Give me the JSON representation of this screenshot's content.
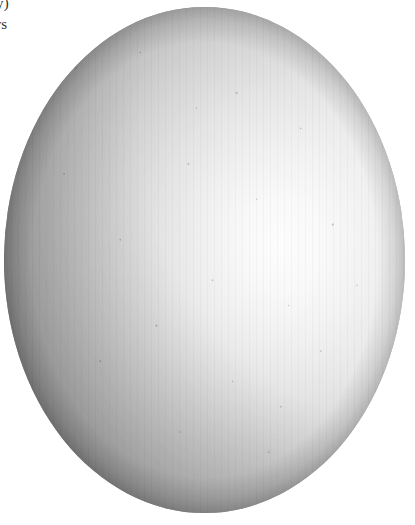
{
  "page": {
    "width": 415,
    "height": 525,
    "background_color": "#ffffff",
    "kind": "scanned-figure"
  },
  "caption": {
    "line_1": "y)",
    "line_2": "rs",
    "note_visible": "text is clipped by the page crop at the left edge",
    "color": "#33302e"
  },
  "figure": {
    "name": "shaded-ovoid",
    "shape": "ellipse",
    "bounds": {
      "left": 4,
      "top": 7,
      "width": 401,
      "height": 506
    },
    "highlight": {
      "center_x_pct": 69,
      "center_y_pct": 47,
      "color": "#fdfdfd"
    },
    "shadow_side": "lower-left",
    "darkest_color": "#4a4a4a",
    "midtone_color": "#9a9a9a",
    "lightest_color": "#fdfdfd",
    "texture": "halftone screen with scan speckle"
  }
}
